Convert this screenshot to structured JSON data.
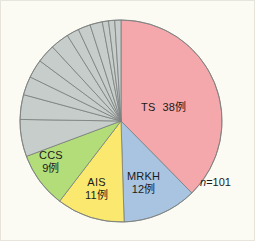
{
  "figure": {
    "background_color": "#fbfaf3",
    "border_color": "#e6e4db",
    "total_note": "n=101",
    "total_note_symbol": "n",
    "total_note_value": "=101"
  },
  "labels": {
    "ts": {
      "name": "TS",
      "value": "38例"
    },
    "mrkh": {
      "name": "MRKH",
      "value": "12例"
    },
    "ais": {
      "name": "AIS",
      "value": "11例"
    },
    "ccs": {
      "name": "CCS",
      "value": "9例"
    }
  },
  "chart_data": {
    "type": "pie",
    "title": "",
    "subtitle": "",
    "xlabel": "",
    "ylabel": "",
    "annotations": [
      "n=101"
    ],
    "total": 101,
    "unit": "例",
    "legend": "none",
    "grid": false,
    "start_angle_deg": 0,
    "direction": "clockwise",
    "center": {
      "x": 120,
      "y": 120
    },
    "radius": 101,
    "stroke_color": "#7a7f7d",
    "stroke_width": 0.8,
    "categories": [
      "TS",
      "MRKH",
      "AIS",
      "CCS",
      "Other"
    ],
    "values": [
      38,
      12,
      11,
      9,
      31
    ],
    "labeled_slices": [
      {
        "name": "TS",
        "value": 38,
        "label": "TS   38例",
        "color": "#f5a8ac"
      },
      {
        "name": "MRKH",
        "value": 12,
        "label": "MRKH 12例",
        "color": "#a8c4e0"
      },
      {
        "name": "AIS",
        "value": 11,
        "label": "AIS 11例",
        "color": "#fae96e"
      },
      {
        "name": "CCS",
        "value": 9,
        "label": "CCS 9例",
        "color": "#b3dd79"
      }
    ],
    "other_group": {
      "name": "Other",
      "total": 31,
      "color": "#c6cdcb",
      "label": "",
      "slice_values": [
        6,
        4,
        3,
        3,
        3,
        3,
        2,
        2,
        2,
        1,
        1,
        1
      ]
    },
    "colors": {
      "ts": "#f5a8ac",
      "mrkh": "#a8c4e0",
      "ais": "#fae96e",
      "ccs": "#b3dd79",
      "other": "#c6cdcb"
    }
  }
}
